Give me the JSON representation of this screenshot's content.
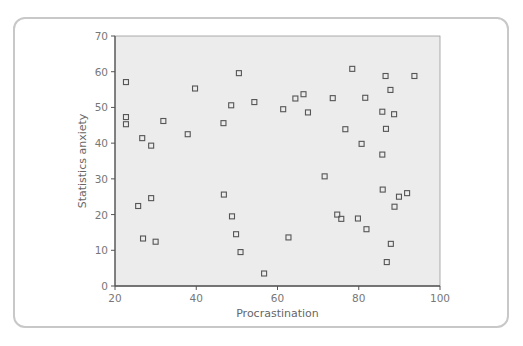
{
  "chart_data": {
    "type": "scatter",
    "title": "",
    "xlabel": "Procrastination",
    "ylabel": "Statistics anxiety",
    "xlim": [
      20,
      100
    ],
    "ylim": [
      0,
      70
    ],
    "xticks": [
      20,
      40,
      60,
      80,
      100
    ],
    "yticks": [
      0,
      10,
      20,
      30,
      40,
      50,
      60,
      70
    ],
    "grid": false,
    "legend": null,
    "marker": "hollow-square",
    "colors": {
      "plot_background": "#ececec",
      "marker": "#555555",
      "axis": "#555555",
      "frame": "#c8c8c8"
    },
    "points": [
      {
        "x": 22.7,
        "y": 57.1
      },
      {
        "x": 22.7,
        "y": 47.3
      },
      {
        "x": 22.7,
        "y": 45.3
      },
      {
        "x": 25.7,
        "y": 22.4
      },
      {
        "x": 26.7,
        "y": 41.4
      },
      {
        "x": 26.9,
        "y": 13.3
      },
      {
        "x": 28.9,
        "y": 39.3
      },
      {
        "x": 28.9,
        "y": 24.6
      },
      {
        "x": 30.0,
        "y": 12.4
      },
      {
        "x": 31.9,
        "y": 46.2
      },
      {
        "x": 37.9,
        "y": 42.5
      },
      {
        "x": 39.7,
        "y": 55.3
      },
      {
        "x": 46.7,
        "y": 45.6
      },
      {
        "x": 46.8,
        "y": 25.6
      },
      {
        "x": 48.6,
        "y": 50.6
      },
      {
        "x": 48.8,
        "y": 19.5
      },
      {
        "x": 49.8,
        "y": 14.5
      },
      {
        "x": 50.5,
        "y": 59.6
      },
      {
        "x": 50.9,
        "y": 9.5
      },
      {
        "x": 54.3,
        "y": 51.5
      },
      {
        "x": 56.7,
        "y": 3.5
      },
      {
        "x": 61.4,
        "y": 49.5
      },
      {
        "x": 62.7,
        "y": 13.6
      },
      {
        "x": 64.4,
        "y": 52.5
      },
      {
        "x": 66.4,
        "y": 53.7
      },
      {
        "x": 67.5,
        "y": 48.6
      },
      {
        "x": 71.6,
        "y": 30.7
      },
      {
        "x": 73.6,
        "y": 52.6
      },
      {
        "x": 74.7,
        "y": 20.0
      },
      {
        "x": 75.7,
        "y": 18.8
      },
      {
        "x": 76.7,
        "y": 43.9
      },
      {
        "x": 78.4,
        "y": 60.8
      },
      {
        "x": 79.8,
        "y": 18.9
      },
      {
        "x": 80.7,
        "y": 39.8
      },
      {
        "x": 81.6,
        "y": 52.7
      },
      {
        "x": 81.9,
        "y": 15.9
      },
      {
        "x": 85.8,
        "y": 48.8
      },
      {
        "x": 85.8,
        "y": 36.8
      },
      {
        "x": 85.9,
        "y": 27.0
      },
      {
        "x": 86.6,
        "y": 58.8
      },
      {
        "x": 86.7,
        "y": 44.0
      },
      {
        "x": 86.9,
        "y": 6.7
      },
      {
        "x": 87.8,
        "y": 54.9
      },
      {
        "x": 87.9,
        "y": 11.8
      },
      {
        "x": 88.7,
        "y": 48.1
      },
      {
        "x": 88.8,
        "y": 22.2
      },
      {
        "x": 89.9,
        "y": 25.0
      },
      {
        "x": 91.9,
        "y": 26.0
      },
      {
        "x": 93.7,
        "y": 58.8
      }
    ]
  }
}
